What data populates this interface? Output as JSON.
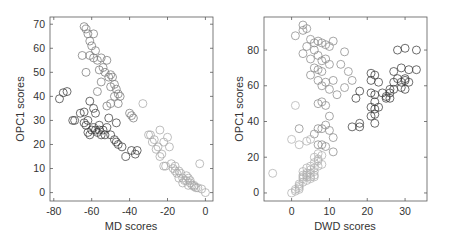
{
  "chart_data": [
    {
      "type": "scatter",
      "title": "",
      "xlabel": "MD scores",
      "ylabel": "OPC1 scores",
      "xlim": [
        -82,
        4
      ],
      "ylim": [
        -3.5,
        73
      ],
      "xticks": [
        -80,
        -60,
        -40,
        -20,
        0
      ],
      "yticks": [
        0,
        10,
        20,
        30,
        40,
        50,
        60,
        70
      ],
      "grid": false,
      "marker": "open-circle",
      "frame": {
        "left": 50,
        "right": 213,
        "top": 17,
        "bottom": 201
      },
      "series": [
        {
          "name": "dark",
          "color": "#3c3c3c",
          "points": [
            [
              -77,
              39
            ],
            [
              -75,
              41.5
            ],
            [
              -73,
              42
            ],
            [
              -70,
              30
            ],
            [
              -69,
              30
            ],
            [
              -66,
              33
            ],
            [
              -64,
              29
            ],
            [
              -63,
              28
            ],
            [
              -62,
              30
            ],
            [
              -61,
              24
            ],
            [
              -60,
              26
            ],
            [
              -59,
              27
            ],
            [
              -58,
              26
            ],
            [
              -57,
              25
            ],
            [
              -56,
              26
            ],
            [
              -55,
              24
            ],
            [
              -54,
              26
            ],
            [
              -53,
              24
            ],
            [
              -52,
              27
            ],
            [
              -51,
              31
            ],
            [
              -48,
              22
            ],
            [
              -47,
              21
            ],
            [
              -46,
              20
            ],
            [
              -44,
              19
            ],
            [
              -42,
              15
            ],
            [
              -39,
              17.5
            ],
            [
              -37,
              16
            ],
            [
              -36,
              17.5
            ],
            [
              -58,
              33
            ],
            [
              -56,
              28
            ],
            [
              -61,
              38
            ],
            [
              -59,
              35
            ],
            [
              -64,
              33.5
            ],
            [
              -62,
              25
            ],
            [
              -50,
              24
            ],
            [
              -47,
              29
            ]
          ]
        },
        {
          "name": "mid",
          "color": "#7a7a7a",
          "points": [
            [
              -64,
              69
            ],
            [
              -63,
              68
            ],
            [
              -62,
              66
            ],
            [
              -59,
              66
            ],
            [
              -61,
              63
            ],
            [
              -60,
              61
            ],
            [
              -58,
              59
            ],
            [
              -61,
              57
            ],
            [
              -59,
              56
            ],
            [
              -57,
              55
            ],
            [
              -55,
              56
            ],
            [
              -56,
              51
            ],
            [
              -54,
              52
            ],
            [
              -53,
              50
            ],
            [
              -52,
              55
            ],
            [
              -51,
              48
            ],
            [
              -50,
              49
            ],
            [
              -49,
              48
            ],
            [
              -50,
              44
            ],
            [
              -48,
              45
            ],
            [
              -47,
              43
            ],
            [
              -46,
              41
            ],
            [
              -45,
              40
            ],
            [
              -48,
              40
            ],
            [
              -55,
              46
            ],
            [
              -52,
              36
            ],
            [
              -50,
              37
            ],
            [
              -46,
              37
            ],
            [
              -40,
              33
            ],
            [
              -39,
              32
            ],
            [
              -38,
              31
            ],
            [
              -63,
              50
            ],
            [
              -65,
              57
            ],
            [
              -57,
              42
            ]
          ]
        },
        {
          "name": "light",
          "color": "#a8a8a8",
          "points": [
            [
              -33,
              37
            ],
            [
              -30,
              24
            ],
            [
              -28,
              21
            ],
            [
              -27,
              22
            ],
            [
              -25,
              19
            ],
            [
              -24,
              26
            ],
            [
              -23,
              16
            ],
            [
              -22,
              21
            ],
            [
              -21,
              11
            ],
            [
              -20,
              23
            ],
            [
              -19,
              19
            ],
            [
              -18,
              12
            ],
            [
              -17,
              10
            ],
            [
              -16,
              11
            ],
            [
              -15,
              8
            ],
            [
              -14,
              9
            ],
            [
              -13,
              8
            ],
            [
              -12,
              6
            ],
            [
              -11,
              5
            ],
            [
              -10,
              5
            ],
            [
              -9,
              6
            ],
            [
              -8,
              4
            ],
            [
              -7,
              3
            ],
            [
              -6,
              3
            ],
            [
              -5,
              2
            ],
            [
              -4,
              2
            ],
            [
              -3,
              12
            ],
            [
              -2,
              1.5
            ],
            [
              0,
              0
            ],
            [
              -12,
              4
            ],
            [
              -10,
              7
            ],
            [
              -8,
              5
            ],
            [
              -9,
              3
            ],
            [
              -14,
              6
            ],
            [
              -16,
              9
            ],
            [
              -24,
              15
            ],
            [
              -26,
              18
            ],
            [
              -29,
              24
            ],
            [
              -22,
              11
            ],
            [
              -6,
              2.5
            ]
          ]
        }
      ]
    },
    {
      "type": "scatter",
      "title": "",
      "xlabel": "DWD scores",
      "ylabel": "OPC1 scores",
      "xlim": [
        -7.3,
        35.8
      ],
      "ylim": [
        -4.5,
        98.5
      ],
      "xticks": [
        0,
        10,
        20,
        30
      ],
      "yticks": [
        0,
        20,
        40,
        60,
        80
      ],
      "grid": false,
      "marker": "open-circle",
      "frame": {
        "left": 264,
        "right": 427,
        "top": 17,
        "bottom": 201
      },
      "series": [
        {
          "name": "dark",
          "color": "#3c3c3c",
          "points": [
            [
              21,
              67
            ],
            [
              22,
              66
            ],
            [
              21,
              63
            ],
            [
              23,
              62
            ],
            [
              21,
              56
            ],
            [
              22,
              55
            ],
            [
              24,
              56
            ],
            [
              25,
              54
            ],
            [
              26,
              56
            ],
            [
              26,
              58
            ],
            [
              27,
              58
            ],
            [
              27,
              62
            ],
            [
              28,
              64
            ],
            [
              29,
              62
            ],
            [
              30,
              63
            ],
            [
              30,
              64
            ],
            [
              31,
              62
            ],
            [
              29,
              59
            ],
            [
              30,
              58
            ],
            [
              27,
              68
            ],
            [
              28,
              80
            ],
            [
              30,
              81
            ],
            [
              33,
              80
            ],
            [
              31,
              69
            ],
            [
              33,
              69
            ],
            [
              22,
              51
            ],
            [
              21,
              48
            ],
            [
              22,
              47
            ],
            [
              23,
              48
            ],
            [
              22,
              44
            ],
            [
              21,
              43
            ],
            [
              22,
              39
            ],
            [
              17,
              53
            ],
            [
              18,
              57
            ],
            [
              16,
              37
            ],
            [
              18,
              39
            ],
            [
              18,
              37
            ],
            [
              26,
              53
            ],
            [
              25,
              53
            ],
            [
              29,
              70
            ]
          ]
        },
        {
          "name": "mid",
          "color": "#8a8a8a",
          "points": [
            [
              3,
              94
            ],
            [
              4,
              92
            ],
            [
              1,
              88
            ],
            [
              3,
              91
            ],
            [
              5,
              86
            ],
            [
              6,
              84
            ],
            [
              7,
              85
            ],
            [
              4,
              82
            ],
            [
              6,
              80
            ],
            [
              8,
              84
            ],
            [
              9,
              83
            ],
            [
              10,
              82
            ],
            [
              11,
              85
            ],
            [
              3,
              78
            ],
            [
              5,
              75
            ],
            [
              7,
              77
            ],
            [
              8,
              74
            ],
            [
              9,
              75
            ],
            [
              10,
              72
            ],
            [
              6,
              70
            ],
            [
              7,
              69
            ],
            [
              8,
              68
            ],
            [
              5,
              66
            ],
            [
              7,
              63
            ],
            [
              9,
              62
            ],
            [
              11,
              63
            ],
            [
              8,
              60
            ],
            [
              10,
              58
            ],
            [
              12,
              55
            ],
            [
              14,
              59
            ],
            [
              15,
              68
            ],
            [
              14,
              79
            ],
            [
              13,
              72
            ],
            [
              16,
              63
            ],
            [
              7,
              50
            ],
            [
              8,
              51
            ],
            [
              9,
              49
            ],
            [
              10,
              43
            ],
            [
              8,
              36
            ],
            [
              9,
              38
            ],
            [
              7,
              36
            ],
            [
              10,
              35
            ],
            [
              11,
              31
            ],
            [
              7,
              27
            ],
            [
              8,
              27
            ],
            [
              9,
              26
            ],
            [
              11,
              23
            ],
            [
              6,
              33
            ],
            [
              2,
              36
            ]
          ]
        },
        {
          "name": "light",
          "color": "#b0b0b0",
          "points": [
            [
              -5,
              11
            ],
            [
              0,
              0
            ],
            [
              1,
              2
            ],
            [
              2,
              3
            ],
            [
              2,
              5
            ],
            [
              3,
              6
            ],
            [
              3,
              8
            ],
            [
              4,
              9
            ],
            [
              4,
              10
            ],
            [
              5,
              9
            ],
            [
              5,
              11
            ],
            [
              6,
              12
            ],
            [
              6,
              10
            ],
            [
              4,
              14
            ],
            [
              5,
              13
            ],
            [
              7,
              15
            ],
            [
              6,
              17
            ],
            [
              7,
              19
            ],
            [
              8,
              21
            ],
            [
              7,
              22
            ],
            [
              6,
              20
            ],
            [
              3,
              12
            ],
            [
              4,
              7
            ],
            [
              5,
              8
            ],
            [
              2,
              4
            ],
            [
              1,
              1
            ],
            [
              0,
              30
            ],
            [
              1,
              49
            ],
            [
              2,
              27
            ],
            [
              4,
              29
            ],
            [
              5,
              30
            ],
            [
              3,
              10
            ],
            [
              5,
              15
            ],
            [
              6,
              14
            ],
            [
              7,
              18
            ],
            [
              8,
              16
            ],
            [
              4,
              11
            ],
            [
              3,
              9
            ],
            [
              6,
              9
            ],
            [
              2,
              2
            ]
          ]
        }
      ]
    }
  ]
}
